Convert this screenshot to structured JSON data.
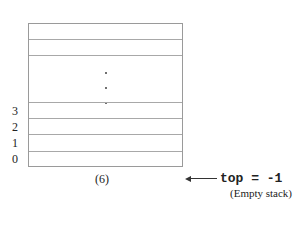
{
  "diagram": {
    "slots_visible_top": 2,
    "slots_visible_bottom": 4,
    "ellipsis": "vertical dots",
    "indices": [
      "3",
      "2",
      "1",
      "0"
    ],
    "caption": "(6)",
    "pointer": {
      "label": "top = -1",
      "note": "(Empty stack)"
    }
  }
}
